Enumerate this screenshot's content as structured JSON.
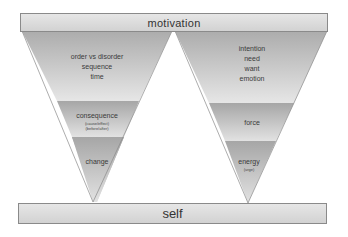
{
  "top_bar": {
    "label": "motivation"
  },
  "bottom_bar": {
    "label": "self"
  },
  "left_funnel": {
    "sections": [
      {
        "lines": [
          "order vs disorder",
          "sequence",
          "time"
        ]
      },
      {
        "title": "consequence",
        "sub": [
          "(cause/effect)",
          "(before/after)"
        ]
      },
      {
        "title": "change"
      }
    ]
  },
  "right_funnel": {
    "sections": [
      {
        "lines": [
          "intention",
          "need",
          "want",
          "emotion"
        ]
      },
      {
        "title": "force"
      },
      {
        "title": "energy",
        "sub": [
          "(urge)"
        ]
      }
    ]
  },
  "colors": {
    "top": "#b4b4b4",
    "mid": "#a8a8a8",
    "light": "#e4e4e4",
    "bar": "#dcdcdc",
    "border": "#8a8a8a"
  }
}
